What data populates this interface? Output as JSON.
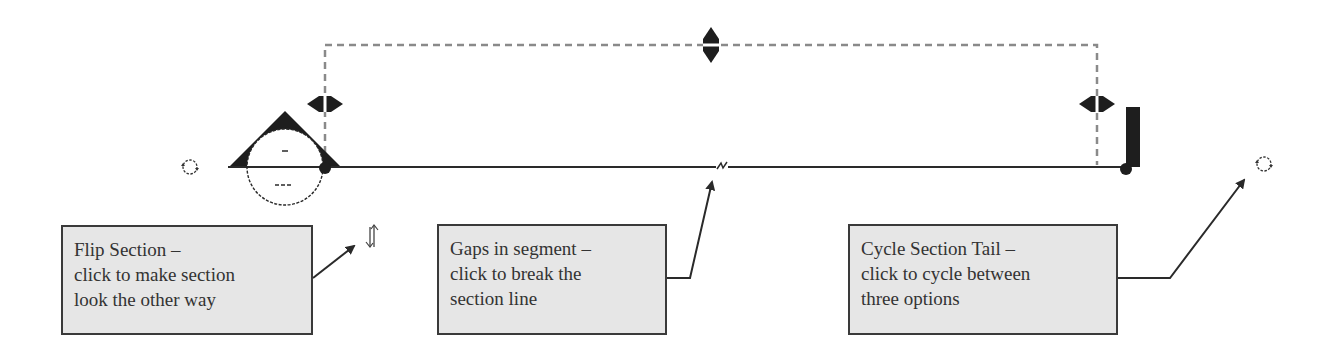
{
  "diagram": {
    "colors": {
      "line": "#2a2a2a",
      "dashed_guide": "#8a8a8a",
      "callout_fill": "#e6e6e6",
      "callout_border": "#3a3a3a",
      "text": "#333333"
    },
    "icons": [
      {
        "name": "rotate-icon-left",
        "position": [
          190,
          167
        ]
      },
      {
        "name": "rotate-icon-right",
        "position": [
          1264,
          163
        ]
      },
      {
        "name": "flip-arrows-icon",
        "position": [
          372,
          237
        ]
      },
      {
        "name": "gap-break-icon",
        "position": [
          722,
          165
        ]
      },
      {
        "name": "section-head-marker",
        "position": [
          285,
          160
        ]
      },
      {
        "name": "section-tail-bar",
        "position": [
          1132,
          145
        ]
      }
    ],
    "callouts": [
      {
        "id": "flip-section",
        "lines": [
          "Flip Section –",
          "click to make section",
          "look the other way"
        ]
      },
      {
        "id": "gaps-in-segment",
        "lines": [
          "Gaps in segment –",
          "click to break the",
          "section line"
        ]
      },
      {
        "id": "cycle-section-tail",
        "lines": [
          "Cycle Section Tail –",
          "click to cycle between",
          "three options"
        ]
      }
    ]
  }
}
